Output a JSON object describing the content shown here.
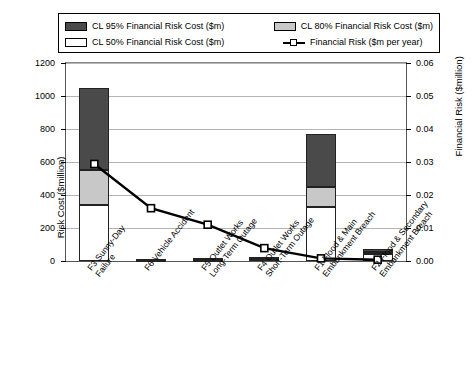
{
  "legend": {
    "items": [
      {
        "label": "CL 95% Financial Risk Cost ($m)",
        "key": "dark-swatch"
      },
      {
        "label": "CL 80% Financial Risk Cost ($m)",
        "key": "gray-swatch"
      },
      {
        "label": "CL 50% Financial Risk Cost ($m)",
        "key": "white-swatch"
      },
      {
        "label": "Financial Risk ($m per year)",
        "key": "line-marker-key"
      }
    ]
  },
  "axes": {
    "left_title": "Risk Cost ($million)",
    "right_title": "Financial Risk ($million)",
    "left_ticks": [
      "0",
      "200",
      "400",
      "600",
      "800",
      "1000",
      "1200"
    ],
    "right_ticks": [
      "0.00",
      "0.01",
      "0.02",
      "0.03",
      "0.04",
      "0.05",
      "0.06"
    ]
  },
  "chart_data": {
    "type": "bar",
    "title": "",
    "xlabel": "",
    "ylabel": "Risk Cost ($million)",
    "y2label": "Financial Risk ($million)",
    "ylim": [
      0,
      1200
    ],
    "y2lim": [
      0,
      0.06
    ],
    "grid": true,
    "legend_position": "top",
    "categories": [
      "F3 Sunny-Day Failure",
      "F6 Vehicle Accident",
      "F5 Outlet Works Long-Term Outage",
      "F4 Outlet Works Short-Term Outage",
      "F1 Flood & Main Embankment Breach",
      "F2 Flood & Secondary Embankment Breach"
    ],
    "series": [
      {
        "name": "CL 50% Financial Risk Cost ($m)",
        "axis": "left",
        "stack": "cost",
        "values": [
          340,
          4,
          6,
          12,
          330,
          40
        ]
      },
      {
        "name": "CL 80% Financial Risk Cost ($m)",
        "axis": "left",
        "stack": "cost",
        "values": [
          210,
          4,
          5,
          6,
          120,
          15
        ]
      },
      {
        "name": "CL 95% Financial Risk Cost ($m)",
        "axis": "left",
        "stack": "cost",
        "values": [
          500,
          6,
          7,
          9,
          320,
          20
        ]
      },
      {
        "name": "Financial Risk ($m per year)",
        "axis": "right",
        "type": "line",
        "values": [
          0.0294,
          0.016,
          0.011,
          0.0039,
          0.0008,
          0.0004
        ]
      }
    ],
    "stack_totals": [
      1050,
      14,
      18,
      27,
      770,
      75
    ]
  }
}
